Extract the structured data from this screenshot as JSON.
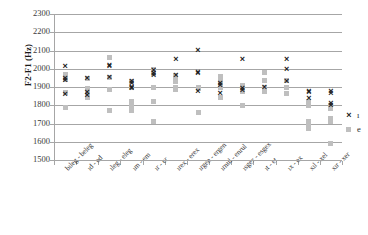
{
  "chart_data": {
    "type": "scatter",
    "title": "",
    "xlabel": "",
    "ylabel": "F2-F1 (Hz)",
    "ylim": [
      1500,
      2300
    ],
    "ytick_step": 100,
    "yticks": [
      2300,
      2200,
      2100,
      2000,
      1900,
      1800,
      1700,
      1600,
      1500
    ],
    "grid": true,
    "legend_position": "right",
    "categories": [
      "bıleg - beleg",
      "ıd - ed",
      "ıleg - eleg",
      "ım - em",
      "ır - er",
      "ırex - erex",
      "ırgen - ergen",
      "ırnul - enrul",
      "ısgex - esgex",
      "ıt - et",
      "ıx - ex",
      "xıl - xel",
      "xır - xer"
    ],
    "series": [
      {
        "name": "ı",
        "marker": "x",
        "color": "#1a1a1a",
        "points": [
          [
            0,
            2012
          ],
          [
            0,
            1948
          ],
          [
            0,
            1938
          ],
          [
            0,
            1858
          ],
          [
            1,
            1948
          ],
          [
            1,
            1868
          ],
          [
            1,
            1856
          ],
          [
            2,
            2020
          ],
          [
            2,
            2010
          ],
          [
            2,
            1950
          ],
          [
            3,
            1928
          ],
          [
            3,
            1918
          ],
          [
            3,
            1900
          ],
          [
            3,
            1893
          ],
          [
            4,
            1988
          ],
          [
            4,
            1975
          ],
          [
            4,
            1963
          ],
          [
            5,
            2050
          ],
          [
            5,
            1962
          ],
          [
            6,
            2100
          ],
          [
            6,
            1982
          ],
          [
            6,
            1972
          ],
          [
            6,
            1878
          ],
          [
            7,
            1920
          ],
          [
            7,
            1908
          ],
          [
            7,
            1866
          ],
          [
            8,
            2050
          ],
          [
            8,
            1893
          ],
          [
            8,
            1880
          ],
          [
            9,
            1898
          ],
          [
            10,
            2048
          ],
          [
            10,
            1996
          ],
          [
            10,
            1930
          ],
          [
            11,
            1878
          ],
          [
            11,
            1872
          ],
          [
            11,
            1836
          ],
          [
            12,
            1876
          ],
          [
            12,
            1862
          ],
          [
            12,
            1812
          ],
          [
            12,
            1798
          ]
        ]
      },
      {
        "name": "e",
        "marker": "square",
        "color": "#bfbfbf",
        "points": [
          [
            0,
            1968
          ],
          [
            0,
            1940
          ],
          [
            0,
            1872
          ],
          [
            0,
            1788
          ],
          [
            1,
            1948
          ],
          [
            1,
            1892
          ],
          [
            1,
            1862
          ],
          [
            1,
            1842
          ],
          [
            2,
            2062
          ],
          [
            2,
            1950
          ],
          [
            2,
            1886
          ],
          [
            2,
            1772
          ],
          [
            3,
            1930
          ],
          [
            3,
            1900
          ],
          [
            3,
            1822
          ],
          [
            3,
            1812
          ],
          [
            3,
            1788
          ],
          [
            3,
            1772
          ],
          [
            4,
            1998
          ],
          [
            4,
            1984
          ],
          [
            4,
            1972
          ],
          [
            4,
            1900
          ],
          [
            4,
            1818
          ],
          [
            4,
            1712
          ],
          [
            5,
            1962
          ],
          [
            5,
            1940
          ],
          [
            5,
            1928
          ],
          [
            5,
            1900
          ],
          [
            5,
            1888
          ],
          [
            6,
            1898
          ],
          [
            6,
            1890
          ],
          [
            6,
            1762
          ],
          [
            7,
            1958
          ],
          [
            7,
            1928
          ],
          [
            7,
            1918
          ],
          [
            7,
            1900
          ],
          [
            7,
            1840
          ],
          [
            8,
            1908
          ],
          [
            8,
            1900
          ],
          [
            8,
            1878
          ],
          [
            8,
            1798
          ],
          [
            9,
            1978
          ],
          [
            9,
            1938
          ],
          [
            9,
            1900
          ],
          [
            9,
            1878
          ],
          [
            10,
            1938
          ],
          [
            10,
            1900
          ],
          [
            10,
            1862
          ],
          [
            11,
            1820
          ],
          [
            11,
            1800
          ],
          [
            11,
            1712
          ],
          [
            11,
            1698
          ],
          [
            11,
            1672
          ],
          [
            12,
            1800
          ],
          [
            12,
            1782
          ],
          [
            12,
            1730
          ],
          [
            12,
            1712
          ],
          [
            12,
            1588
          ]
        ]
      }
    ],
    "legend": [
      {
        "label": "ı",
        "marker": "x"
      },
      {
        "label": "e",
        "marker": "square"
      }
    ]
  }
}
